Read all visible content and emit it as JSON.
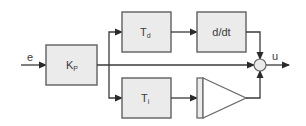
{
  "diagram": {
    "colors": {
      "block_fill": "#ebebeb",
      "block_stroke": "#6a6a6a",
      "line": "#3a3a3a",
      "text": "#3a3a3a",
      "background": "#ffffff"
    },
    "input": {
      "label": "e"
    },
    "output": {
      "label": "u"
    },
    "blocks": {
      "kp": {
        "main": "K",
        "sub": "P"
      },
      "td": {
        "main": "T",
        "sub": "d"
      },
      "ddt": {
        "label": "d/dt"
      },
      "ti": {
        "main": "T",
        "sub": "i"
      },
      "integrator": {
        "label": ""
      },
      "sum": {
        "label": ""
      }
    },
    "connections": [
      "e -> Kp",
      "Kp -> Td",
      "Kp -> Sum",
      "Kp -> Ti",
      "Td -> d/dt",
      "d/dt -> Sum",
      "Ti -> Integrator",
      "Integrator -> Sum",
      "Sum -> u"
    ]
  }
}
